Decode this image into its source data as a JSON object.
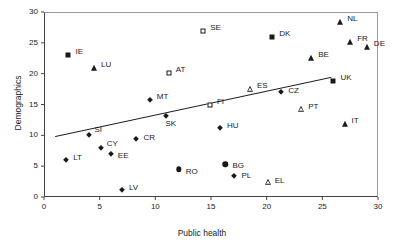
{
  "chart_data": {
    "type": "scatter",
    "title": "",
    "xlabel": "Public health",
    "ylabel": "Demographics",
    "xlim": [
      0,
      30
    ],
    "ylim": [
      0,
      30
    ],
    "xticks": [
      "0",
      "5",
      "10",
      "15",
      "20",
      "25",
      "30"
    ],
    "yticks": [
      "0",
      "5",
      "10",
      "15",
      "20",
      "25",
      "30"
    ],
    "grid": false,
    "legend": "none",
    "marker_color": "#1a1a1a",
    "trendline": {
      "present": true,
      "x_start": 1.0,
      "y_start": 9.8,
      "x_end": 25.8,
      "y_end": 19.4
    },
    "points": [
      {
        "label": "IE",
        "x": 2.2,
        "y": 23.0,
        "marker": "filled-square",
        "label_dx": 7,
        "label_dy": -3
      },
      {
        "label": "LU",
        "x": 4.5,
        "y": 21.0,
        "marker": "filled-triangle",
        "label_dx": 7,
        "label_dy": -3
      },
      {
        "label": "SE",
        "x": 14.3,
        "y": 27.0,
        "marker": "hollow-square",
        "label_dx": 7,
        "label_dy": -3
      },
      {
        "label": "DK",
        "x": 20.5,
        "y": 26.0,
        "marker": "filled-square",
        "label_dx": 7,
        "label_dy": -3
      },
      {
        "label": "NL",
        "x": 26.6,
        "y": 28.3,
        "marker": "filled-triangle",
        "label_dx": 7,
        "label_dy": -3
      },
      {
        "label": "FR",
        "x": 27.5,
        "y": 25.2,
        "marker": "filled-triangle",
        "label_dx": 7,
        "label_dy": -3
      },
      {
        "label": "DE",
        "x": 29.0,
        "y": 24.4,
        "marker": "filled-triangle",
        "label_dx": 7,
        "label_dy": -3
      },
      {
        "label": "BE",
        "x": 24.0,
        "y": 22.5,
        "marker": "filled-triangle",
        "label_dx": 7,
        "label_dy": -3
      },
      {
        "label": "AT",
        "x": 11.2,
        "y": 20.1,
        "marker": "hollow-square",
        "label_dx": 7,
        "label_dy": -3
      },
      {
        "label": "UK",
        "x": 26.0,
        "y": 18.8,
        "marker": "filled-square",
        "label_dx": 7,
        "label_dy": -3
      },
      {
        "label": "ES",
        "x": 18.5,
        "y": 17.5,
        "marker": "hollow-triangle",
        "label_dx": 7,
        "label_dy": -3
      },
      {
        "label": "MT",
        "x": 9.5,
        "y": 15.8,
        "marker": "filled-diamond",
        "label_dx": 7,
        "label_dy": -3
      },
      {
        "label": "CZ",
        "x": 21.3,
        "y": 17.0,
        "marker": "filled-diamond",
        "label_dx": 7,
        "label_dy": -1
      },
      {
        "label": "FI",
        "x": 14.9,
        "y": 15.0,
        "marker": "hollow-square",
        "label_dx": 7,
        "label_dy": -3
      },
      {
        "label": "PT",
        "x": 23.1,
        "y": 14.3,
        "marker": "hollow-triangle",
        "label_dx": 7,
        "label_dy": -2
      },
      {
        "label": "SK",
        "x": 11.0,
        "y": 13.1,
        "marker": "filled-diamond",
        "label_dx": -1,
        "label_dy": 8
      },
      {
        "label": "IT",
        "x": 27.0,
        "y": 11.9,
        "marker": "filled-triangle",
        "label_dx": 7,
        "label_dy": -3
      },
      {
        "label": "HU",
        "x": 15.8,
        "y": 11.2,
        "marker": "filled-diamond",
        "label_dx": 7,
        "label_dy": -2
      },
      {
        "label": "SI",
        "x": 4.0,
        "y": 10.0,
        "marker": "filled-diamond",
        "label_dx": 6,
        "label_dy": -5
      },
      {
        "label": "CR",
        "x": 8.3,
        "y": 9.4,
        "marker": "filled-diamond",
        "label_dx": 7,
        "label_dy": -1
      },
      {
        "label": "CY",
        "x": 5.1,
        "y": 8.0,
        "marker": "filled-diamond",
        "label_dx": 6,
        "label_dy": -4
      },
      {
        "label": "EE",
        "x": 6.0,
        "y": 7.0,
        "marker": "filled-diamond",
        "label_dx": 7,
        "label_dy": 2
      },
      {
        "label": "LT",
        "x": 2.0,
        "y": 6.0,
        "marker": "filled-diamond",
        "label_dx": 7,
        "label_dy": -2
      },
      {
        "label": "BG",
        "x": 16.3,
        "y": 5.3,
        "marker": "filled-circle",
        "label_dx": 7,
        "label_dy": 2
      },
      {
        "label": "RO",
        "x": 12.1,
        "y": 4.5,
        "marker": "filled-circle",
        "label_dx": 7,
        "label_dy": 3
      },
      {
        "label": "PL",
        "x": 17.1,
        "y": 3.4,
        "marker": "filled-diamond",
        "label_dx": 7,
        "label_dy": 0
      },
      {
        "label": "EL",
        "x": 20.1,
        "y": 2.4,
        "marker": "hollow-triangle",
        "label_dx": 7,
        "label_dy": -1
      },
      {
        "label": "LV",
        "x": 7.0,
        "y": 1.1,
        "marker": "filled-diamond",
        "label_dx": 7,
        "label_dy": -2
      }
    ]
  }
}
